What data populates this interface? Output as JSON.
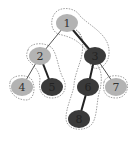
{
  "diagram": {
    "type": "binary-tree-path-decomposition",
    "colors": {
      "light_node": "#b3b3b3",
      "dark_node": "#3a3a3a",
      "light_label": "#333333",
      "dark_label": "#222222",
      "thin_edge": "#555555",
      "thick_edge": "#222222",
      "dashed_outline": "#888888"
    },
    "nodes": [
      {
        "id": "1",
        "label": "1",
        "x": 67,
        "y": 23,
        "shade": "light"
      },
      {
        "id": "2",
        "label": "2",
        "x": 40,
        "y": 56,
        "shade": "light"
      },
      {
        "id": "3",
        "label": "3",
        "x": 95,
        "y": 56,
        "shade": "dark"
      },
      {
        "id": "4",
        "label": "4",
        "x": 22,
        "y": 87,
        "shade": "light"
      },
      {
        "id": "5",
        "label": "5",
        "x": 52,
        "y": 87,
        "shade": "dark"
      },
      {
        "id": "6",
        "label": "6",
        "x": 88,
        "y": 87,
        "shade": "dark"
      },
      {
        "id": "7",
        "label": "7",
        "x": 116,
        "y": 87,
        "shade": "light"
      },
      {
        "id": "8",
        "label": "8",
        "x": 79,
        "y": 119,
        "shade": "dark"
      }
    ],
    "edges": [
      {
        "from": "1",
        "to": "2",
        "style": "thin"
      },
      {
        "from": "1",
        "to": "3",
        "style": "thick"
      },
      {
        "from": "2",
        "to": "4",
        "style": "thin"
      },
      {
        "from": "2",
        "to": "5",
        "style": "thick"
      },
      {
        "from": "3",
        "to": "6",
        "style": "thick"
      },
      {
        "from": "3",
        "to": "7",
        "style": "thin"
      },
      {
        "from": "6",
        "to": "8",
        "style": "thick"
      }
    ],
    "groups": [
      {
        "name": "path-1-3",
        "members": [
          "1",
          "3"
        ]
      },
      {
        "name": "path-2-5",
        "members": [
          "2",
          "5"
        ]
      },
      {
        "name": "path-4",
        "members": [
          "4"
        ]
      },
      {
        "name": "path-7",
        "members": [
          "7"
        ]
      },
      {
        "name": "path-6-8",
        "members": [
          "6",
          "8"
        ]
      }
    ]
  }
}
